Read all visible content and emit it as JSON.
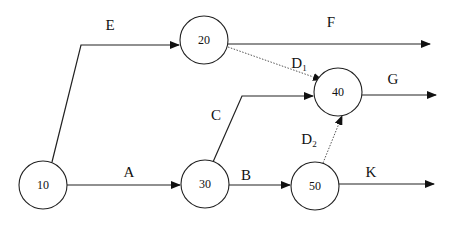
{
  "diagram": {
    "type": "activity-on-arrow network",
    "nodes": [
      {
        "id": "10",
        "label": "10",
        "cx": 43,
        "cy": 185
      },
      {
        "id": "20",
        "label": "20",
        "cx": 204,
        "cy": 40
      },
      {
        "id": "30",
        "label": "30",
        "cx": 205,
        "cy": 183
      },
      {
        "id": "40",
        "label": "40",
        "cx": 338,
        "cy": 89
      },
      {
        "id": "50",
        "label": "50",
        "cx": 315,
        "cy": 187
      }
    ],
    "edges": [
      {
        "id": "E",
        "label": "E",
        "sub": "",
        "from": "10",
        "to": "20",
        "dummy": false
      },
      {
        "id": "F",
        "label": "F",
        "sub": "",
        "from": "20",
        "to": "end",
        "dummy": false
      },
      {
        "id": "D1",
        "label": "D",
        "sub": "1",
        "from": "20",
        "to": "40",
        "dummy": true
      },
      {
        "id": "G",
        "label": "G",
        "sub": "",
        "from": "40",
        "to": "end",
        "dummy": false
      },
      {
        "id": "C",
        "label": "C",
        "sub": "",
        "from": "30",
        "to": "40",
        "dummy": false
      },
      {
        "id": "A",
        "label": "A",
        "sub": "",
        "from": "10",
        "to": "30",
        "dummy": false
      },
      {
        "id": "B",
        "label": "B",
        "sub": "",
        "from": "30",
        "to": "50",
        "dummy": false
      },
      {
        "id": "D2",
        "label": "D",
        "sub": "2",
        "from": "50",
        "to": "40",
        "dummy": true
      },
      {
        "id": "K",
        "label": "K",
        "sub": "",
        "from": "50",
        "to": "end",
        "dummy": false
      }
    ]
  },
  "labels": {
    "n10": "10",
    "n20": "20",
    "n30": "30",
    "n40": "40",
    "n50": "50",
    "E": "E",
    "F": "F",
    "G": "G",
    "C": "C",
    "A": "A",
    "B": "B",
    "K": "K",
    "D": "D",
    "D1_sub": "1",
    "D2_sub": "2"
  }
}
